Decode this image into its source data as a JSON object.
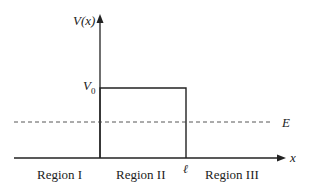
{
  "diagram": {
    "y_axis_label": "V(x)",
    "x_axis_label": "x",
    "barrier_height_label_main": "V",
    "barrier_height_label_sub": "0",
    "energy_label": "E",
    "barrier_width_label": "ℓ",
    "regions": [
      {
        "label": "Region I"
      },
      {
        "label": "Region II"
      },
      {
        "label": "Region III"
      }
    ],
    "colors": {
      "line": "#222222",
      "background": "#ffffff"
    }
  }
}
